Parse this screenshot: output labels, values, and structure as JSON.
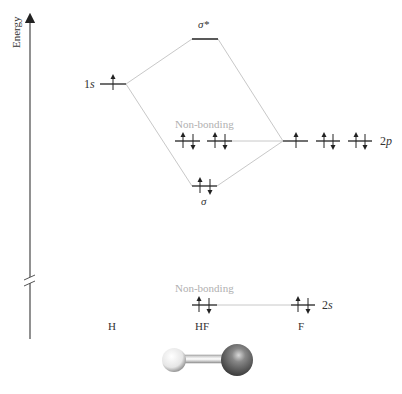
{
  "axis": {
    "label": "Energy",
    "axis_break": true
  },
  "colors": {
    "level": "#222222",
    "correlation": "#c8c8c8",
    "label": "#333333",
    "nonbonding_label": "#b0b0b0",
    "h_atom": "#f0f0f0",
    "f_atom": "#555555"
  },
  "atoms": {
    "left": "H",
    "center": "HF",
    "right": "F"
  },
  "orbitals": {
    "h_1s": {
      "label": "1s",
      "electrons": "↑"
    },
    "sigma_star": {
      "label": "σ*",
      "electrons": ""
    },
    "nonbonding_2p": {
      "label": "Non-bonding",
      "electrons": [
        "↑↓",
        "↑↓"
      ]
    },
    "sigma": {
      "label": "σ",
      "electrons": "↑↓"
    },
    "f_2p": {
      "label": "2p",
      "electrons": [
        "↑",
        "↑↓",
        "↑↓"
      ]
    },
    "nonbonding_2s": {
      "label": "Non-bonding",
      "electrons": "↑↓"
    },
    "f_2s": {
      "label": "2s",
      "electrons": "↑↓"
    }
  },
  "molecule": {
    "atoms": [
      "H",
      "F"
    ]
  }
}
